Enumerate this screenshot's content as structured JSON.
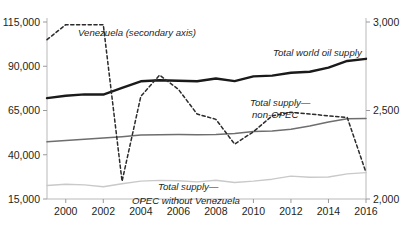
{
  "chart_data": {
    "type": "line",
    "title": "",
    "xlabel": "",
    "ylabel": "",
    "x": [
      1999,
      2000,
      2001,
      2002,
      2003,
      2004,
      2005,
      2006,
      2007,
      2008,
      2009,
      2010,
      2011,
      2012,
      2013,
      2014,
      2015,
      2016
    ],
    "xticks": [
      "2000",
      "2002",
      "2004",
      "2006",
      "2008",
      "2010",
      "2012",
      "2014",
      "2016"
    ],
    "xtick_values": [
      2000,
      2002,
      2004,
      2006,
      2008,
      2010,
      2012,
      2014,
      2016
    ],
    "xlim": [
      1999,
      2016
    ],
    "grid": false,
    "legend_position": "inline-annotations",
    "axes": {
      "left": {
        "ticks": [
          "15,000",
          "40,000",
          "65,000",
          "90,000",
          "115,000"
        ],
        "tick_values": [
          15000,
          40000,
          65000,
          90000,
          115000
        ],
        "ylim": [
          15000,
          115000
        ],
        "position": "left"
      },
      "right": {
        "ticks": [
          "2,000",
          "2,500",
          "3,000"
        ],
        "tick_values": [
          2000,
          2500,
          3000
        ],
        "ylim": [
          2000,
          3000
        ],
        "position": "right",
        "note": "secondary axis"
      }
    },
    "series": [
      {
        "name": "Total world oil supply",
        "label": "Total world oil supply",
        "axis": "left",
        "style": "solid",
        "color": "#1a1a1a",
        "width": 2.4,
        "values": [
          72000,
          73300,
          74100,
          74000,
          77800,
          81500,
          82100,
          81800,
          81500,
          83100,
          81600,
          84300,
          84700,
          86300,
          86900,
          89200,
          93000,
          94200
        ]
      },
      {
        "name": "Total supply—non-OPEC",
        "label": "Total supply—non-OPEC",
        "axis": "left",
        "style": "solid",
        "color": "#6e6e6e",
        "width": 1.5,
        "values": [
          47300,
          48100,
          48700,
          49400,
          50200,
          51100,
          51300,
          51400,
          51300,
          51500,
          52000,
          53100,
          53400,
          54400,
          56200,
          58500,
          60400,
          60500
        ]
      },
      {
        "name": "Total supply—OPEC without Venezuela",
        "label": "Total supply—OPEC without Venezuela",
        "axis": "left",
        "style": "solid",
        "color": "#c9c9c9",
        "width": 1.4,
        "values": [
          22600,
          23300,
          23000,
          21900,
          23600,
          25100,
          25500,
          25300,
          24700,
          25600,
          24300,
          25100,
          26200,
          27900,
          27300,
          27400,
          29200,
          29900
        ]
      },
      {
        "name": "Venezuela (secondary axis)",
        "label": "Venezuela (secondary axis)",
        "axis": "right",
        "style": "dashed",
        "color": "#2b2b2b",
        "width": 1.5,
        "values": [
          2900,
          2985,
          2985,
          2985,
          2100,
          2580,
          2700,
          2620,
          2480,
          2450,
          2310,
          2380,
          2470,
          2490,
          2480,
          2470,
          2460,
          2150
        ]
      }
    ],
    "annotations": [
      {
        "text": "Venezuela (secondary axis)",
        "x": 78,
        "y": 36,
        "series": "Venezuela (secondary axis)"
      },
      {
        "text": "Total world oil supply",
        "x": 273,
        "y": 56,
        "series": "Total world oil supply"
      },
      {
        "text": "Total supply—",
        "x": 250,
        "y": 106,
        "series": "Total supply—non-OPEC"
      },
      {
        "text": "non-OPEC",
        "x": 252,
        "y": 118,
        "series": "Total supply—non-OPEC"
      },
      {
        "text": "Total supply—",
        "x": 158,
        "y": 190,
        "series": "Total supply—OPEC without Venezuela"
      },
      {
        "text": "OPEC without Venezuela",
        "x": 132,
        "y": 204,
        "series": "Total supply—OPEC without Venezuela"
      }
    ]
  }
}
